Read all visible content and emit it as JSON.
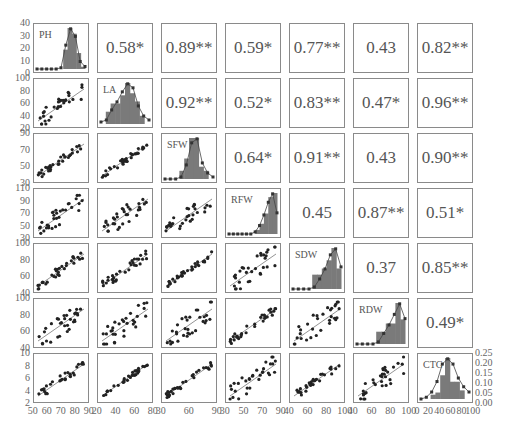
{
  "chart_data": {
    "type": "scatter-matrix",
    "title": "",
    "variables": [
      "PH",
      "LA",
      "SFW",
      "RFW",
      "SDW",
      "RDW",
      "CTG"
    ],
    "upper_triangle_correlations": [
      {
        "row": "PH",
        "col": "LA",
        "value": "0.58*"
      },
      {
        "row": "PH",
        "col": "SFW",
        "value": "0.89**"
      },
      {
        "row": "PH",
        "col": "RFW",
        "value": "0.59*"
      },
      {
        "row": "PH",
        "col": "SDW",
        "value": "0.77**"
      },
      {
        "row": "PH",
        "col": "RDW",
        "value": "0.43"
      },
      {
        "row": "PH",
        "col": "CTG",
        "value": "0.82**"
      },
      {
        "row": "LA",
        "col": "SFW",
        "value": "0.92**"
      },
      {
        "row": "LA",
        "col": "RFW",
        "value": "0.52*"
      },
      {
        "row": "LA",
        "col": "SDW",
        "value": "0.83**"
      },
      {
        "row": "LA",
        "col": "RDW",
        "value": "0.47*"
      },
      {
        "row": "LA",
        "col": "CTG",
        "value": "0.96**"
      },
      {
        "row": "SFW",
        "col": "RFW",
        "value": "0.64*"
      },
      {
        "row": "SFW",
        "col": "SDW",
        "value": "0.91**"
      },
      {
        "row": "SFW",
        "col": "RDW",
        "value": "0.43"
      },
      {
        "row": "SFW",
        "col": "CTG",
        "value": "0.90**"
      },
      {
        "row": "RFW",
        "col": "SDW",
        "value": "0.45"
      },
      {
        "row": "RFW",
        "col": "RDW",
        "value": "0.87**"
      },
      {
        "row": "RFW",
        "col": "CTG",
        "value": "0.51*"
      },
      {
        "row": "SDW",
        "col": "RDW",
        "value": "0.37"
      },
      {
        "row": "SDW",
        "col": "CTG",
        "value": "0.85**"
      },
      {
        "row": "RDW",
        "col": "CTG",
        "value": "0.49*"
      }
    ],
    "correlation_grid": [
      [
        null,
        "0.58*",
        "0.89**",
        "0.59*",
        "0.77**",
        "0.43",
        "0.82**"
      ],
      [
        null,
        null,
        "0.92**",
        "0.52*",
        "0.83**",
        "0.47*",
        "0.96**"
      ],
      [
        null,
        null,
        null,
        "0.64*",
        "0.91**",
        "0.43",
        "0.90**"
      ],
      [
        null,
        null,
        null,
        null,
        "0.45",
        "0.87**",
        "0.51*"
      ],
      [
        null,
        null,
        null,
        null,
        null,
        "0.37",
        "0.85**"
      ],
      [
        null,
        null,
        null,
        null,
        null,
        null,
        "0.49*"
      ],
      [
        null,
        null,
        null,
        null,
        null,
        null,
        null
      ]
    ],
    "diagonal": "histogram with density line per variable",
    "lower_triangle": "scatter plots with linear fit lines",
    "y_axis_ticks": {
      "PH_hist": [
        "0",
        "10",
        "20",
        "30",
        "40"
      ],
      "LA": [
        "20",
        "40",
        "60",
        "80",
        "100"
      ],
      "SFW": [
        "30",
        "50",
        "70",
        "90"
      ],
      "RFW": [
        "30",
        "50",
        "70",
        "90",
        "110"
      ],
      "SDW": [
        "40",
        "60",
        "80",
        "100"
      ],
      "RDW": [
        "40",
        "60",
        "80",
        "100"
      ],
      "CTG": [
        "2",
        "4",
        "6",
        "8",
        "10"
      ],
      "CTG_density_right": [
        "0.00",
        "0.05",
        "0.10",
        "0.15",
        "0.20",
        "0.25"
      ]
    },
    "x_axis_ticks": {
      "PH": [
        "50",
        "60",
        "70",
        "80",
        "90"
      ],
      "LA": [
        "20",
        "40",
        "60",
        "80"
      ],
      "SFW": [
        "30",
        "60",
        "90"
      ],
      "RFW": [
        "30",
        "50",
        "70",
        "90"
      ],
      "SDW": [
        "40",
        "60",
        "80",
        "100"
      ],
      "RDW": [
        "40",
        "60",
        "80",
        "100"
      ],
      "CTG": [
        "0",
        "20",
        "40",
        "60",
        "80",
        "100"
      ]
    },
    "histograms": {
      "PH": {
        "bars": [
          0,
          0,
          0,
          0,
          0,
          0,
          17,
          36,
          31,
          14,
          2
        ],
        "line": [
          0,
          0,
          0,
          0,
          0,
          1,
          19,
          32,
          26,
          6,
          2
        ]
      },
      "LA": {
        "bars": [
          0,
          0.3,
          0.5,
          0.5,
          0.7,
          1.0,
          0.75,
          0.55,
          0.2,
          0
        ],
        "line": [
          0.05,
          0.1,
          0.35,
          0.55,
          0.8,
          1.0,
          0.9,
          0.45,
          0.2,
          0.1
        ]
      },
      "SFW": {
        "bars": [
          0,
          0,
          0,
          0.2,
          0.5,
          1.0,
          1.0,
          0.3,
          0.2,
          0
        ],
        "line": [
          0,
          0,
          0,
          0.05,
          0.35,
          0.9,
          1.0,
          0.4,
          0.15,
          0.05
        ]
      },
      "RFW": {
        "bars": [
          0,
          0,
          0,
          0,
          0,
          0,
          0.1,
          0.25,
          0.5,
          0.9,
          1.0
        ],
        "line": [
          0,
          0,
          0,
          0,
          0,
          0,
          0.05,
          0.2,
          0.45,
          0.75,
          0.95,
          0.5
        ]
      },
      "SDW": {
        "bars": [
          0,
          0,
          0,
          0,
          0.35,
          0.35,
          0.5,
          0.7,
          1.0,
          0.5
        ],
        "line": [
          0,
          0,
          0,
          0,
          0.05,
          0.25,
          0.5,
          0.85,
          1.0,
          0.55
        ]
      },
      "RDW": {
        "bars": [
          0,
          0,
          0,
          0,
          0.3,
          0.3,
          0.5,
          0.5,
          1.0,
          0.6
        ],
        "line": [
          0,
          0,
          0,
          0,
          0.05,
          0.25,
          0.45,
          0.7,
          0.95,
          0.6
        ]
      },
      "CTG": {
        "bars": [
          0,
          0,
          0.1,
          0.15,
          0.55,
          0.95,
          0.4,
          0.4,
          0.2,
          0
        ],
        "line": [
          0,
          0.01,
          0.04,
          0.1,
          0.2,
          0.23,
          0.2,
          0.12,
          0.07,
          0.04
        ]
      }
    },
    "legend": null,
    "grid": false
  }
}
